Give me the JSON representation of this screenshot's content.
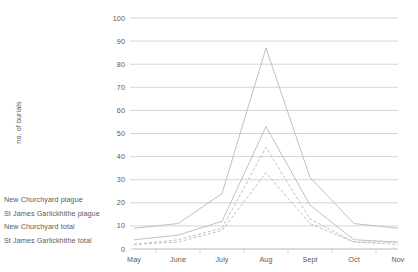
{
  "legend": {
    "items": [
      {
        "label": "New Churchyard plague",
        "series_key": "new_churchyard_plague",
        "style": "dashed"
      },
      {
        "label": "St James Garlickhithe plague",
        "series_key": "st_james_garlickhithe_plague",
        "style": "dashed"
      },
      {
        "label": "New Churchyard total",
        "series_key": "new_churchyard_total",
        "style": "solid"
      },
      {
        "label": "St James Garlickhithe total",
        "series_key": "st_james_garlickhithe_total",
        "style": "solid"
      }
    ]
  },
  "colors": {
    "line": "#b9b9bb",
    "grid": "#c9c9cb",
    "text": "#5a5a5c",
    "background": "#ffffff"
  },
  "chart_data": {
    "type": "line",
    "title": "",
    "xlabel": "",
    "ylabel": "no. of burials",
    "categories": [
      "May",
      "June",
      "July",
      "Aug",
      "Sept",
      "Oct",
      "Nov"
    ],
    "ylim": [
      0,
      100
    ],
    "ytick_labels": [
      "0",
      "10",
      "20",
      "30",
      "40",
      "50",
      "60",
      "70",
      "80",
      "90",
      "100"
    ],
    "ytick_values": [
      0,
      10,
      20,
      30,
      40,
      50,
      60,
      70,
      80,
      90,
      100
    ],
    "grid": true,
    "legend_position": "left",
    "series": [
      {
        "name": "New Churchyard total",
        "style": "solid",
        "values": [
          9,
          11,
          24,
          87,
          31,
          11,
          9
        ]
      },
      {
        "name": "St James Garlickhithe total",
        "style": "solid",
        "values": [
          4,
          6,
          12,
          53,
          19,
          4,
          3
        ]
      },
      {
        "name": "New Churchyard plague",
        "style": "dashed",
        "values": [
          2,
          4,
          9,
          44,
          13,
          3,
          3
        ]
      },
      {
        "name": "St James Garlickhithe plague",
        "style": "dashed",
        "values": [
          2,
          3,
          8,
          33,
          11,
          3,
          2
        ]
      }
    ]
  }
}
